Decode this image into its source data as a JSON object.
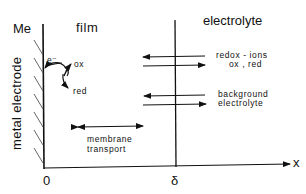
{
  "diagram": {
    "title_left_region": "film",
    "title_right_region": "electrolyte",
    "electrode_symbol": "Me",
    "electrode_label": "metal electrode",
    "electron_label": "e⁻",
    "ox_label": "ox",
    "red_label": "red",
    "redox_ions_line1": "redox - ions",
    "redox_ions_line2": "ox , red",
    "background_line1": "background",
    "background_line2": "electrolyte",
    "membrane_line1": "membrane",
    "membrane_line2": "transport",
    "axis": {
      "x_label": "x",
      "origin_tick": "0",
      "delta_tick": "δ"
    },
    "colors": {
      "ink": "#111111",
      "background": "#ffffff"
    }
  }
}
